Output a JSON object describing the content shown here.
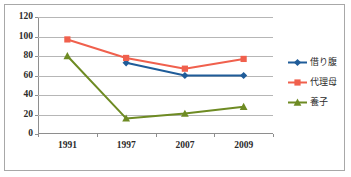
{
  "chart_data": {
    "type": "line",
    "title": "",
    "xlabel": "",
    "ylabel": "",
    "categories": [
      "1991",
      "1997",
      "2007",
      "2009"
    ],
    "ylim": [
      0,
      120
    ],
    "ytick_labels": [
      "0",
      "20",
      "40",
      "60",
      "80",
      "100",
      "120"
    ],
    "ytick_values": [
      0,
      20,
      40,
      60,
      80,
      100,
      120
    ],
    "grid": true,
    "legend_position": "right",
    "series": [
      {
        "name": "借り腹",
        "color": "#1F5C99",
        "marker": "diamond",
        "values": [
          null,
          73,
          60,
          60
        ]
      },
      {
        "name": "代理母",
        "color": "#F0604D",
        "marker": "square",
        "values": [
          97,
          78,
          67,
          77
        ]
      },
      {
        "name": "養子",
        "color": "#6E8B23",
        "marker": "triangle",
        "values": [
          80,
          16,
          21,
          28
        ]
      }
    ]
  },
  "style": {
    "background": "#ffffff",
    "border_color": "#a8a8a8",
    "gridline_color": "#b6b6b6",
    "axis_color": "#8e8e8e",
    "tick_text_color": "#2b2b2b"
  }
}
